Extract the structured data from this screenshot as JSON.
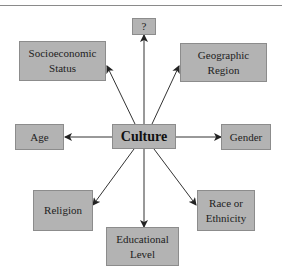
{
  "diagram": {
    "center": {
      "label": "Culture"
    },
    "nodes": [
      {
        "id": "unknown",
        "label": "?"
      },
      {
        "id": "socioeconomic",
        "label": "Socioeconomic Status"
      },
      {
        "id": "geographic",
        "label": "Geographic Region"
      },
      {
        "id": "age",
        "label": "Age"
      },
      {
        "id": "gender",
        "label": "Gender"
      },
      {
        "id": "religion",
        "label": "Religion"
      },
      {
        "id": "race",
        "label": "Race or Ethnicity"
      },
      {
        "id": "education",
        "label": "Educational Level"
      }
    ],
    "edges": [
      {
        "from": "Culture",
        "to": "?"
      },
      {
        "from": "Culture",
        "to": "Socioeconomic Status"
      },
      {
        "from": "Culture",
        "to": "Geographic Region"
      },
      {
        "from": "Culture",
        "to": "Age"
      },
      {
        "from": "Culture",
        "to": "Gender"
      },
      {
        "from": "Culture",
        "to": "Religion"
      },
      {
        "from": "Culture",
        "to": "Race or Ethnicity"
      },
      {
        "from": "Culture",
        "to": "Educational Level"
      }
    ],
    "colors": {
      "box_fill": "#b3b3b3",
      "box_border": "#8c8c8c",
      "arrow": "#222222"
    }
  }
}
